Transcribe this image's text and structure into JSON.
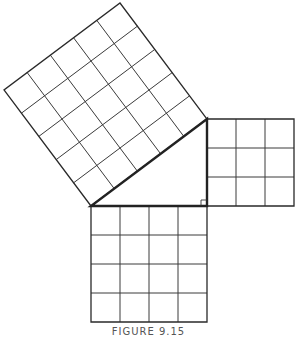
{
  "figure": {
    "caption": "FIGURE 9.15",
    "triangle": {
      "vertices": {
        "A_top": [
          207,
          119
        ],
        "B_left": [
          91,
          206
        ],
        "C_right_angle": [
          207,
          206
        ]
      },
      "legs": {
        "vertical_units": 3,
        "horizontal_units": 4
      },
      "hypotenuse_units": 5
    },
    "squares": [
      {
        "name": "leg-square-3",
        "side": 3,
        "cells": 9,
        "grid": "3x3"
      },
      {
        "name": "leg-square-4",
        "side": 4,
        "cells": 16,
        "grid": "4x4"
      },
      {
        "name": "hypotenuse-square-5",
        "side": 5,
        "cells": 25,
        "grid": "5x5"
      }
    ],
    "colors": {
      "line": "#3a3a3a",
      "background": "#ffffff",
      "caption": "#555555"
    }
  }
}
